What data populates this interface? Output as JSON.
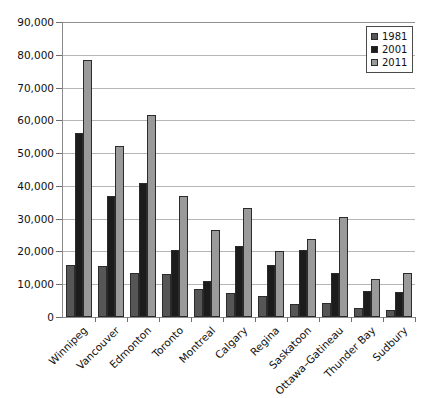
{
  "chart_data": {
    "type": "bar",
    "title": "",
    "subtitle": "",
    "xlabel": "",
    "ylabel": "",
    "ylim": [
      0,
      90000
    ],
    "ytick_values": [
      0,
      10000,
      20000,
      30000,
      40000,
      50000,
      60000,
      70000,
      80000,
      90000
    ],
    "ytick_labels": [
      "0",
      "10,000",
      "20,000",
      "30,000",
      "40,000",
      "50,000",
      "60,000",
      "70,000",
      "80,000",
      "90,000"
    ],
    "grid": true,
    "legend_position": "top-right",
    "categories": [
      "Winnipeg",
      "Vancouver",
      "Edmonton",
      "Toronto",
      "Montreal",
      "Calgary",
      "Regina",
      "Saskatoon",
      "Ottawa–Gatineau",
      "Thunder Bay",
      "Sudbury"
    ],
    "series": [
      {
        "name": "1981",
        "color": "#565656",
        "values": [
          16000,
          15500,
          13500,
          13000,
          8500,
          7200,
          6500,
          4000,
          4200,
          2800,
          2200
        ]
      },
      {
        "name": "2001",
        "color": "#1c1c1c",
        "values": [
          56000,
          36800,
          41000,
          20500,
          11000,
          21800,
          16000,
          20300,
          13500,
          8000,
          7700
        ]
      },
      {
        "name": "2011",
        "color": "#9a9a9a",
        "values": [
          78500,
          52300,
          61500,
          37000,
          26500,
          33200,
          20000,
          23800,
          30600,
          11600,
          13500
        ]
      }
    ]
  },
  "legend": {
    "items": [
      {
        "label": "1981",
        "color": "#565656"
      },
      {
        "label": "2001",
        "color": "#1c1c1c"
      },
      {
        "label": "2011",
        "color": "#9a9a9a"
      }
    ]
  },
  "axes": {
    "grid_color": "#b6b6b6",
    "axis_color": "#8a8a8a",
    "tick_color": "#6f6f6f"
  }
}
